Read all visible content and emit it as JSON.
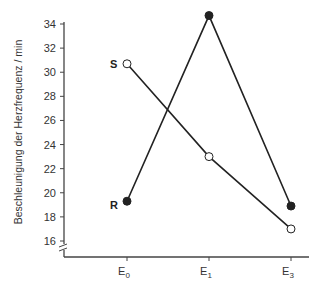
{
  "chart_data": {
    "type": "line",
    "title": "",
    "xlabel": "",
    "ylabel": "Beschleunigung der Herzfrequenz / min",
    "categories": [
      "E0",
      "E1",
      "E3"
    ],
    "category_labels": [
      {
        "main": "E",
        "sub": "0"
      },
      {
        "main": "E",
        "sub": "1"
      },
      {
        "main": "E",
        "sub": "3"
      }
    ],
    "ylim": [
      16,
      34
    ],
    "yticks": [
      16,
      18,
      20,
      22,
      24,
      26,
      28,
      30,
      32,
      34
    ],
    "axis_break": true,
    "grid": false,
    "legend": "inline labels at first point",
    "series": [
      {
        "name": "S",
        "marker": "open-circle",
        "values": [
          30.7,
          23.0,
          17.0
        ]
      },
      {
        "name": "R",
        "marker": "filled-circle",
        "values": [
          19.3,
          34.7,
          18.9
        ]
      }
    ]
  },
  "colors": {
    "line": "#222222",
    "axis": "#444444",
    "background": "#ffffff"
  }
}
